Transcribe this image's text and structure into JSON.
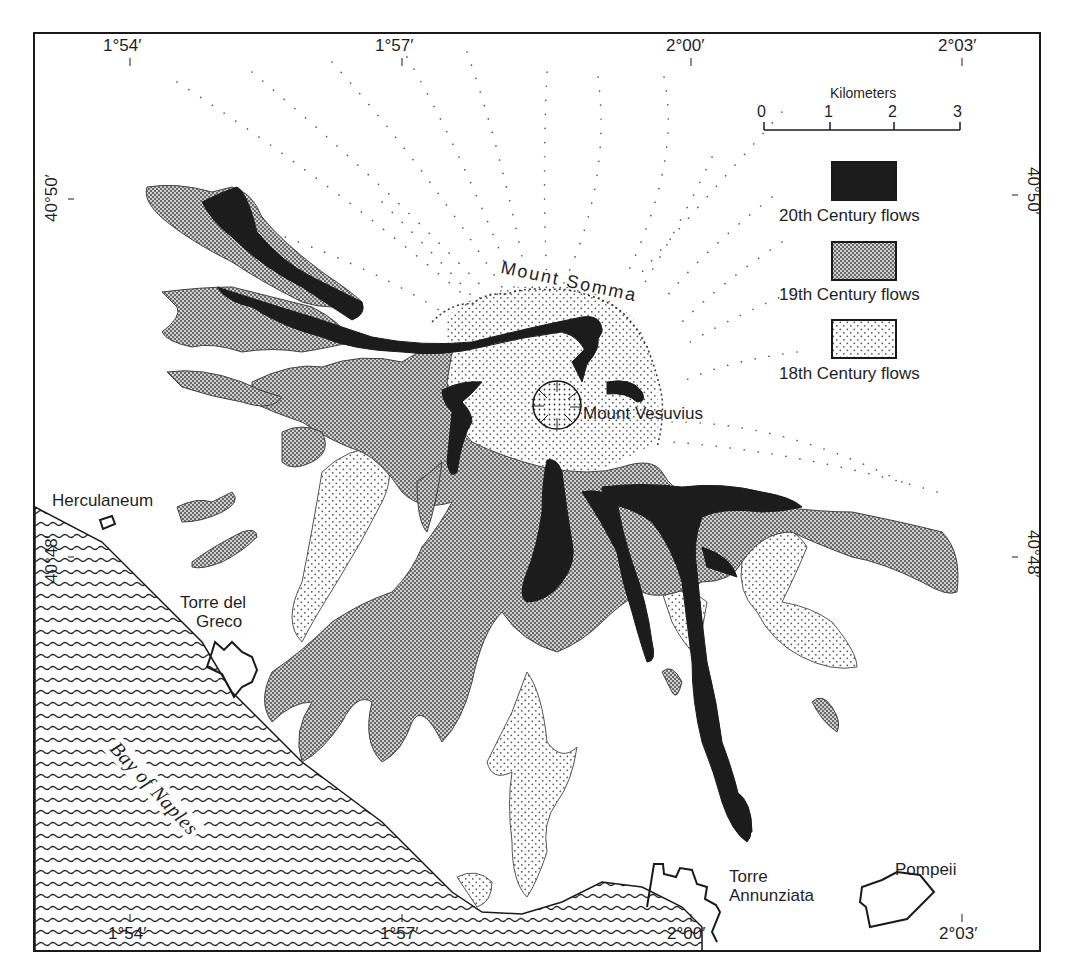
{
  "map": {
    "type": "geologic map",
    "subject": "Lava flows of Mount Vesuvius"
  },
  "coordinates": {
    "top": [
      "1°54′",
      "1°57′",
      "2°00′",
      "2°03′"
    ],
    "bottom": [
      "1°54′",
      "1°57′",
      "2°00′",
      "2°03′"
    ],
    "left": [
      "40°50′",
      "40°48′"
    ],
    "right": [
      "40°50′",
      "40°48′"
    ]
  },
  "scale": {
    "title": "Kilometers",
    "ticks": [
      "0",
      "1",
      "2",
      "3"
    ]
  },
  "legend": {
    "items": [
      {
        "label": "20th Century flows",
        "pattern": "solid-black",
        "color": "#1c1c1c"
      },
      {
        "label": "19th Century flows",
        "pattern": "gray-checker",
        "color": "#8a8a8a"
      },
      {
        "label": "18th Century flows",
        "pattern": "sparse-dots",
        "color": "#f4f4f4"
      }
    ]
  },
  "places": {
    "mount_somma": "Mount Somma",
    "mount_vesuvius": "Mount Vesuvius",
    "herculaneum": "Herculaneum",
    "torre_del_greco_1": "Torre del",
    "torre_del_greco_2": "Greco",
    "torre_annunziata_1": "Torre",
    "torre_annunziata_2": "Annunziata",
    "pompeii": "Pompeii",
    "bay_of_naples": "Bay of Naples"
  },
  "colors": {
    "ink": "#1a1a1a",
    "flow20": "#1c1c1c",
    "flow19_dark": "#6e6e6e",
    "flow19_light": "#c8c8c8",
    "flow18_dot": "#555555",
    "water_line": "#2a2a2a"
  }
}
